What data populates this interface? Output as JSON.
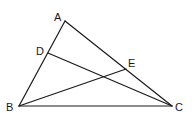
{
  "diagram": {
    "type": "geometry-triangle",
    "points": {
      "A": {
        "label": "A",
        "x": 65,
        "y": 21
      },
      "B": {
        "label": "B",
        "x": 19,
        "y": 106
      },
      "C": {
        "label": "C",
        "x": 172,
        "y": 106
      },
      "D": {
        "label": "D",
        "x": 48,
        "y": 53
      },
      "E": {
        "label": "E",
        "x": 126,
        "y": 69
      }
    },
    "segments": [
      "AB",
      "BC",
      "CA",
      "DC",
      "BE"
    ],
    "labels": {
      "A": "A",
      "B": "B",
      "C": "C",
      "D": "D",
      "E": "E"
    },
    "colors": {
      "stroke": "#1a1a1a",
      "background": "#ffffff"
    }
  }
}
